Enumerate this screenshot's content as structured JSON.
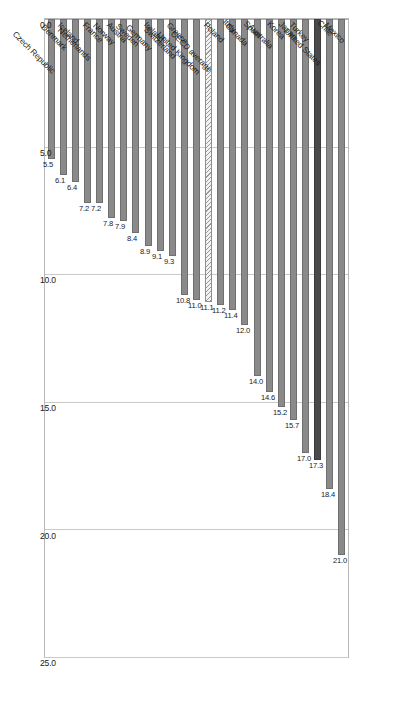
{
  "chart_data": {
    "type": "bar",
    "orientation": "horizontal",
    "title": "",
    "subtitle": "",
    "xlabel": "",
    "ylabel": "",
    "xlim": [
      0.0,
      25.0
    ],
    "xticks": [
      "0.0",
      "5.0",
      "10.0",
      "15.0",
      "20.0",
      "25.0"
    ],
    "xtick_values": [
      0.0,
      5.0,
      10.0,
      15.0,
      20.0,
      25.0
    ],
    "grid": "vertical",
    "legend": "none",
    "categories": [
      "Mexico",
      "Chile",
      "United States",
      "Turkey",
      "Japan",
      "Korea",
      "Australia",
      "Spain",
      "Canada",
      "Italy",
      "Poland",
      "OECD average",
      "United Kingdom",
      "Greece",
      "Switzerland",
      "Ireland",
      "Germany",
      "Sweden",
      "Austria",
      "Norway",
      "France",
      "Netherlands",
      "Iceland",
      "Denmark",
      "Czech Republic"
    ],
    "values": [
      21.0,
      18.4,
      17.3,
      17.0,
      15.7,
      15.2,
      14.6,
      14.0,
      12.0,
      11.4,
      11.2,
      11.1,
      11.0,
      10.8,
      9.3,
      9.1,
      8.9,
      8.4,
      7.9,
      7.8,
      7.2,
      7.2,
      6.4,
      6.1,
      5.5
    ],
    "value_labels": [
      "21.0",
      "18.4",
      "17.3",
      "17.0",
      "15.7",
      "15.2",
      "14.6",
      "14.0",
      "12.0",
      "11.4",
      "11.2",
      "11.1",
      "11.0",
      "10.8",
      "9.3",
      "9.1",
      "8.9",
      "8.4",
      "7.9",
      "7.8",
      "7.2",
      "7.2",
      "6.4",
      "6.1",
      "5.5"
    ],
    "styles": [
      "normal",
      "normal",
      "highlight",
      "normal",
      "normal",
      "normal",
      "normal",
      "normal",
      "normal",
      "normal",
      "normal",
      "pattern",
      "normal",
      "normal",
      "normal",
      "normal",
      "normal",
      "normal",
      "normal",
      "normal",
      "normal",
      "normal",
      "normal",
      "normal",
      "normal"
    ],
    "colors": {
      "bar": "#8a8a8a",
      "highlight": "#4a4a4a",
      "pattern_fill": "#f2f2f2",
      "pattern_stroke": "#9a9a9a",
      "gridline": "#c9c9c9",
      "frame": "#b9b9b9",
      "text": "#1a1a1a",
      "background": "#ffffff"
    }
  }
}
